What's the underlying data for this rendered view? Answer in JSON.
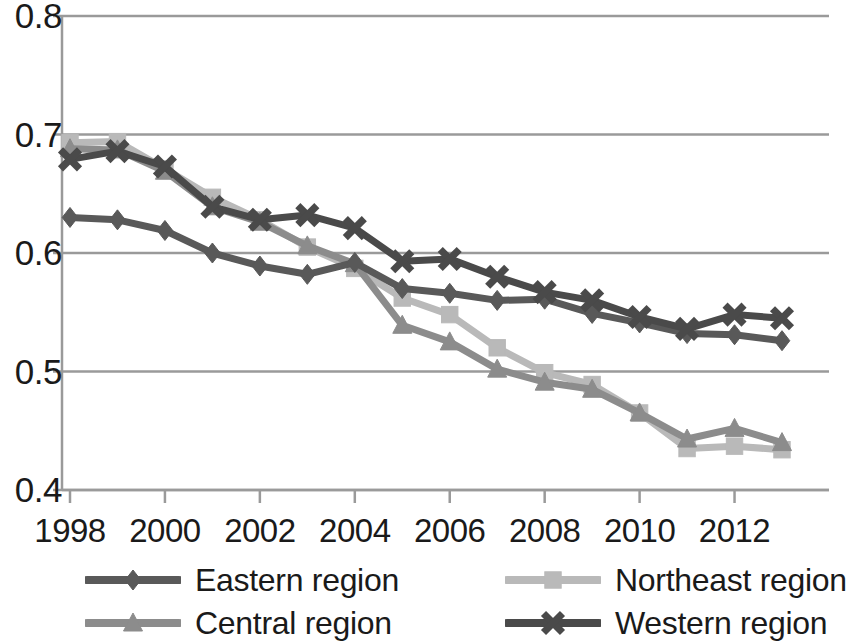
{
  "chart_data": {
    "type": "line",
    "title": "",
    "subtitle": "",
    "xlabel": "",
    "ylabel": "",
    "xlim": [
      1998,
      2013
    ],
    "ylim": [
      0.4,
      0.8
    ],
    "grid": true,
    "legend_position": "bottom",
    "x": [
      1998,
      1999,
      2000,
      2001,
      2002,
      2003,
      2004,
      2005,
      2006,
      2007,
      2008,
      2009,
      2010,
      2011,
      2012,
      2013
    ],
    "xtick_labels": [
      "1998",
      "2000",
      "2002",
      "2004",
      "2006",
      "2008",
      "2010",
      "2012"
    ],
    "xticks": [
      1998,
      2000,
      2002,
      2004,
      2006,
      2008,
      2010,
      2012
    ],
    "ytick_labels": [
      "0.4",
      "0.5",
      "0.6",
      "0.7",
      "0.8"
    ],
    "yticks": [
      0.4,
      0.5,
      0.6,
      0.7,
      0.8
    ],
    "series": [
      {
        "name": "Eastern region",
        "marker": "diamond",
        "color": "#595959",
        "values": [
          0.63,
          0.628,
          0.619,
          0.6,
          0.589,
          0.582,
          0.592,
          0.57,
          0.566,
          0.56,
          0.561,
          0.549,
          0.541,
          0.532,
          0.531,
          0.526
        ]
      },
      {
        "name": "Northeast region",
        "marker": "square",
        "color": "#b9b9b9",
        "values": [
          0.693,
          0.694,
          0.671,
          0.647,
          0.628,
          0.605,
          0.587,
          0.562,
          0.548,
          0.52,
          0.499,
          0.489,
          0.465,
          0.435,
          0.437,
          0.434
        ]
      },
      {
        "name": "Central region",
        "marker": "triangle",
        "color": "#8c8c8c",
        "values": [
          0.688,
          0.687,
          0.669,
          0.639,
          0.626,
          0.606,
          0.591,
          0.539,
          0.525,
          0.502,
          0.491,
          0.485,
          0.465,
          0.443,
          0.452,
          0.44
        ]
      },
      {
        "name": "Western region",
        "marker": "x",
        "color": "#4a4a4a",
        "values": [
          0.679,
          0.686,
          0.673,
          0.639,
          0.628,
          0.632,
          0.621,
          0.593,
          0.595,
          0.58,
          0.567,
          0.56,
          0.546,
          0.536,
          0.548,
          0.545
        ]
      }
    ]
  },
  "axes": {
    "axis_color": "#9a9a9a",
    "grid_color": "#9a9a9a",
    "label_color": "#1a1a1a"
  }
}
